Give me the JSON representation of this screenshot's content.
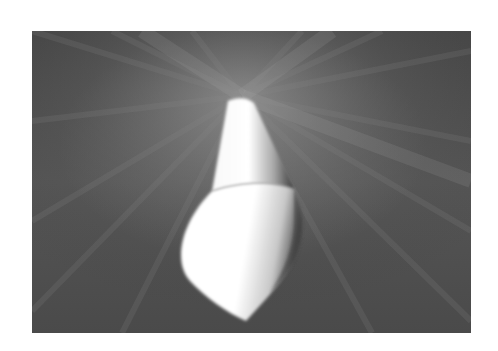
{
  "photo": {
    "subject": "white spindle/cone-shaped object",
    "background": "radial motion-blur streaks, grayscale",
    "colors": {
      "background": "#4c4c4c",
      "highlight": "#ffffff",
      "shadow": "#2e2e2e"
    }
  }
}
